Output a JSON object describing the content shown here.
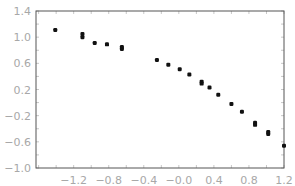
{
  "chart_data": {
    "type": "scatter",
    "title": "",
    "xlabel": "",
    "ylabel": "",
    "xlim": [
      -1.63,
      1.2
    ],
    "ylim": [
      -1.0,
      1.4
    ],
    "xticks": [
      -1.2,
      -0.8,
      -0.4,
      0.0,
      0.4,
      0.8,
      1.2
    ],
    "xtick_labels": [
      "−1.2",
      "−0.8",
      "−0.4",
      "−0.0",
      "0.4",
      "0.8",
      "1.2"
    ],
    "yticks": [
      1.4,
      1.0,
      0.6,
      0.2,
      -0.2,
      -0.6,
      -1.0
    ],
    "ytick_labels": [
      "1.4",
      "1.0",
      "0.6",
      "0.2",
      "−0.2",
      "−0.6",
      "−1.0"
    ],
    "grid": false,
    "legend": null,
    "marker_color": "#111111",
    "frame_color": "#555555",
    "series": [
      {
        "name": "data",
        "points": [
          [
            -1.41,
            1.11
          ],
          [
            -1.1,
            1.05
          ],
          [
            -1.1,
            1.0
          ],
          [
            -0.96,
            0.91
          ],
          [
            -0.82,
            0.89
          ],
          [
            -0.65,
            0.85
          ],
          [
            -0.65,
            0.82
          ],
          [
            -0.25,
            0.65
          ],
          [
            -0.12,
            0.58
          ],
          [
            0.01,
            0.51
          ],
          [
            0.12,
            0.43
          ],
          [
            0.26,
            0.32
          ],
          [
            0.26,
            0.29
          ],
          [
            0.35,
            0.23
          ],
          [
            0.45,
            0.12
          ],
          [
            0.6,
            -0.02
          ],
          [
            0.72,
            -0.14
          ],
          [
            0.87,
            -0.31
          ],
          [
            0.87,
            -0.34
          ],
          [
            1.02,
            -0.45
          ],
          [
            1.02,
            -0.48
          ],
          [
            1.23,
            -0.66
          ]
        ]
      }
    ]
  }
}
